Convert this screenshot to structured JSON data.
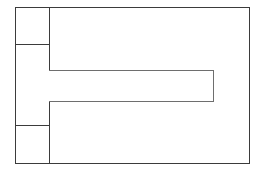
{
  "diagram": {
    "type": "wireframe-layout",
    "title": "Wireframe layout diagram",
    "background_color": "#ffffff",
    "canvas": {
      "width": 260,
      "height": 170
    },
    "outer_frame": {
      "label": "",
      "stroke_color": "#3b3b3b",
      "stroke_width": 1.4,
      "x": 15,
      "y": 7,
      "width": 235,
      "height": 157
    },
    "sidebar": {
      "label": "",
      "x": 15,
      "y": 7,
      "width": 34,
      "height": 157,
      "divider_color": "#3b3b3b",
      "cells": [
        {
          "name": "sidebar-cell-top",
          "label": "",
          "y": 7,
          "height": 37
        },
        {
          "name": "sidebar-cell-middle",
          "label": "",
          "y": 44,
          "height": 81
        },
        {
          "name": "sidebar-cell-bottom",
          "label": "",
          "y": 125,
          "height": 39
        }
      ]
    },
    "main_area": {
      "label": "",
      "x": 49,
      "y": 7,
      "width": 201,
      "height": 157
    },
    "content_bar": {
      "label": "",
      "stroke_color": "#6e6e6e",
      "stroke_width": 1.4,
      "x": 49,
      "y": 70,
      "width": 164,
      "height": 31
    }
  }
}
